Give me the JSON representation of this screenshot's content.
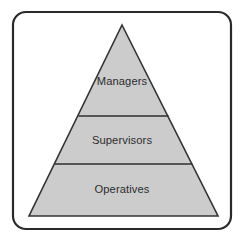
{
  "diagram": {
    "type": "pyramid",
    "canvas": {
      "width": 243,
      "height": 247,
      "background": "#ffffff"
    },
    "frame": {
      "name": "rounded-rectangle-border",
      "x": 13,
      "y": 12,
      "width": 218,
      "height": 217,
      "corner_radius": 13,
      "stroke_color": "#2a2a2a",
      "stroke_width": 2.2,
      "fill": "#ffffff"
    },
    "pyramid": {
      "apex_x": 122,
      "apex_y": 25,
      "base_left_x": 29,
      "base_right_x": 218,
      "base_y": 216,
      "fill_color": "#cccccc",
      "stroke_color": "#333333",
      "stroke_width": 1.6,
      "divider_color": "#2f2f2f",
      "divider_width": 1.6
    },
    "tiers": [
      {
        "id": "tier-managers",
        "label": "Managers",
        "level": 1,
        "position": "top",
        "label_x": 122,
        "label_y": 82,
        "divider_below_y": 116
      },
      {
        "id": "tier-supervisors",
        "label": "Supervisors",
        "level": 2,
        "position": "middle",
        "label_x": 122,
        "label_y": 141,
        "divider_below_y": 164
      },
      {
        "id": "tier-operatives",
        "label": "Operatives",
        "level": 3,
        "position": "bottom",
        "label_x": 122,
        "label_y": 190,
        "divider_below_y": null
      }
    ]
  }
}
